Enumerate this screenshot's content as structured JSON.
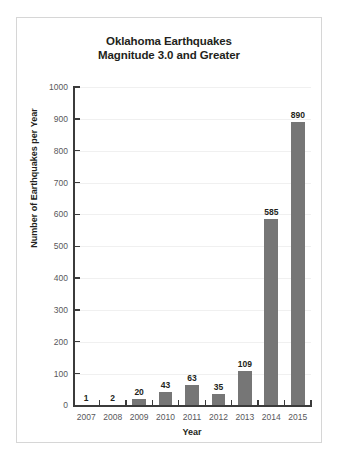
{
  "chart_data": {
    "type": "bar",
    "title": "Oklahoma Earthquakes Magnitude 3.0 and Greater",
    "title_line1": "Oklahoma Earthquakes",
    "title_line2": "Magnitude 3.0 and Greater",
    "xlabel": "Year",
    "ylabel": "Number of Earthquakes per Year",
    "categories": [
      "2007",
      "2008",
      "2009",
      "2010",
      "2011",
      "2012",
      "2013",
      "2014",
      "2015"
    ],
    "values": [
      1,
      2,
      20,
      43,
      63,
      35,
      109,
      585,
      890
    ],
    "value_labels": [
      "1",
      "2",
      "20",
      "43",
      "63",
      "35",
      "109",
      "585",
      "890"
    ],
    "ylim": [
      0,
      1000
    ],
    "ytick_labels": [
      "0",
      "100",
      "200",
      "300",
      "400",
      "500",
      "600",
      "700",
      "800",
      "900",
      "1000"
    ],
    "ytick_values": [
      0,
      100,
      200,
      300,
      400,
      500,
      600,
      700,
      800,
      900,
      1000
    ],
    "grid": true,
    "legend": "none",
    "bar_color": "#767676",
    "axis_color": "#3b3b3b",
    "grid_color": "#f0f0f0",
    "text_color": "#231f20",
    "tick_text_color": "#58585b",
    "frame_color": "#d6d6d6",
    "background": "#ffffff"
  }
}
